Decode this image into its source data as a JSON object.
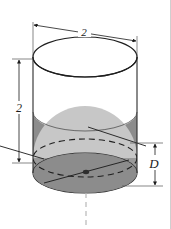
{
  "figure": {
    "kind": "geometry-diagram",
    "caption": "",
    "background_color": "#ffffff",
    "outline_color": "#1a1a1a",
    "shapes": {
      "cylinder": {
        "name": "cylinder",
        "top_face_fill": "#ffffff",
        "body_fill": "#ffffff",
        "liquid_fill": "#8f8f8f",
        "outline_color": "#2a2a2a"
      },
      "sphere": {
        "name": "sphere",
        "fill": "#c9c9c9",
        "shadow_fill": "#b3b3b3",
        "equator_style": "dashed",
        "center_dot_color": "#3a3a3a"
      }
    },
    "dimensions": [
      {
        "id": "top-diameter",
        "label": "2",
        "orientation": "horizontal-slanted",
        "position": "top",
        "arrows": "both"
      },
      {
        "id": "left-height",
        "label": "2",
        "orientation": "vertical",
        "position": "left",
        "arrows": "both"
      },
      {
        "id": "right-depth",
        "label": "D",
        "orientation": "vertical",
        "position": "right",
        "arrows": "both"
      }
    ],
    "leader_lines": [
      {
        "id": "sphere-radius-leader",
        "from": "sphere-surface",
        "to": "right"
      },
      {
        "id": "sphere-diameter-chord",
        "from": "lower-left",
        "to": "upper-right"
      },
      {
        "id": "axis-dashed",
        "from": "bottom-center",
        "to": "below",
        "style": "dashed"
      }
    ],
    "border": {
      "right_edge_visible": true,
      "color": "#cccccc"
    }
  }
}
